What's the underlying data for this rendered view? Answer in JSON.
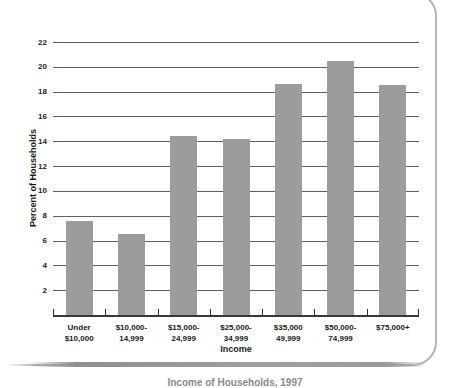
{
  "chart_data": {
    "type": "bar",
    "title": "",
    "categories": [
      [
        "Under",
        "$10,000"
      ],
      [
        "$10,000-",
        "14,999"
      ],
      [
        "$15,000-",
        "24,999"
      ],
      [
        "$25,000-",
        "34,999"
      ],
      [
        "$35,000",
        "49,999"
      ],
      [
        "$50,000-",
        "74,999"
      ],
      [
        "$75,000+"
      ]
    ],
    "values": [
      7.6,
      6.5,
      14.4,
      14.2,
      18.6,
      20.5,
      18.5
    ],
    "xlabel": "Income",
    "ylabel": "Percent of Households",
    "ylim": [
      0,
      22
    ],
    "yticks": [
      2,
      4,
      6,
      8,
      10,
      12,
      14,
      16,
      18,
      20,
      22
    ],
    "grid": true,
    "legend": "none",
    "bar_color": "#9c9c9c",
    "gridline_color": "#606060",
    "axis_color": "#383838",
    "text_color": "#1b1b1b"
  },
  "caption": {
    "text": "Income of Households, 1997"
  }
}
